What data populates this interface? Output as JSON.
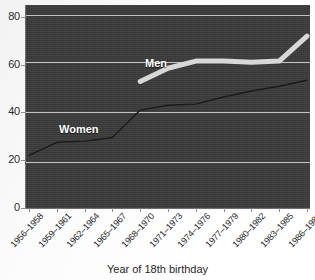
{
  "chart_data": {
    "type": "line",
    "title": "",
    "xlabel": "Year of 18th birthday",
    "ylabel": "",
    "ylim": [
      0,
      85
    ],
    "yticks": [
      0,
      20,
      40,
      60,
      80
    ],
    "grid": true,
    "legend_position": "inline-labels",
    "categories": [
      "1956–1958",
      "1959–1961",
      "1962–1964",
      "1965–1967",
      "1968–1970",
      "1971–1973",
      "1974–1976",
      "1977–1979",
      "1980–1982",
      "1983–1985",
      "1986–1988"
    ],
    "series": [
      {
        "name": "Men",
        "color": "#d8d8d8",
        "line_width": 5,
        "values": [
          null,
          null,
          null,
          null,
          53,
          58.5,
          61.5,
          61.5,
          61,
          61.5,
          72
        ]
      },
      {
        "name": "Women",
        "color": "#1b1b1b",
        "line_width": 1.4,
        "values": [
          22,
          27.5,
          28,
          29.5,
          41,
          43,
          43.5,
          46.5,
          49,
          51,
          53.5
        ]
      }
    ],
    "annotations": [
      {
        "text": "Men",
        "series": "Men"
      },
      {
        "text": "Women",
        "series": "Women"
      }
    ]
  },
  "axis": {
    "y_tick_labels": [
      "80",
      "60",
      "40",
      "20",
      "0"
    ],
    "x_tick_labels": [
      "1956–1958",
      "1959–1961",
      "1962–1964",
      "1965–1967",
      "1968–1970",
      "1971–1973",
      "1974–1976",
      "1977–1979",
      "1980–1982",
      "1983–1985",
      "1986–1988"
    ],
    "x_title": "Year of 18th birthday"
  },
  "labels": {
    "men": "Men",
    "women": "Women"
  },
  "colors": {
    "plot_background": "#3a3a3a",
    "gridline": "#e8e8e8",
    "men_line": "#d8d8d8",
    "women_line": "#1b1b1b",
    "page_background": "#ffffff",
    "text": "#1f1f1f"
  }
}
